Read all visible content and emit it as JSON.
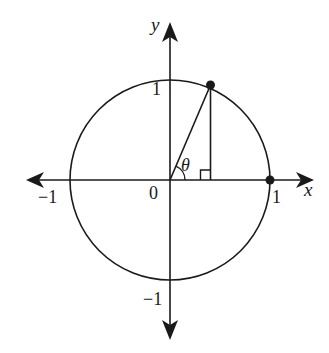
{
  "diagram": {
    "type": "unit-circle",
    "axes": {
      "x_label": "x",
      "y_label": "y",
      "origin_label": "0"
    },
    "ticks": {
      "x_pos": "1",
      "x_neg": "−1",
      "y_pos": "1",
      "y_neg": "−1"
    },
    "angle_label": "θ",
    "points": [
      {
        "name": "point-on-circle",
        "angle_deg": 67
      },
      {
        "name": "point-1-0",
        "x": 1,
        "y": 0
      }
    ],
    "colors": {
      "stroke": "#1a1a1a",
      "background": "#ffffff"
    }
  }
}
